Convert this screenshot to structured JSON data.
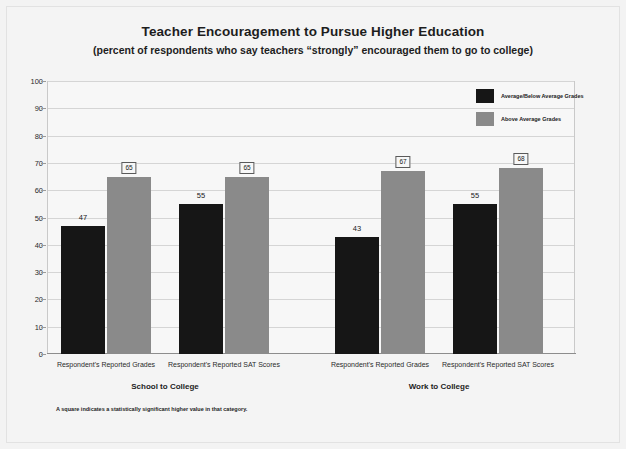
{
  "chart_data": {
    "type": "bar",
    "title": "Teacher Encouragement to Pursue Higher Education",
    "subtitle": "(percent of respondents who say teachers “strongly” encouraged them to go to college)",
    "xlabel": "",
    "ylabel": "",
    "ylim": [
      0,
      100
    ],
    "ytick_labels": [
      "0",
      "10",
      "20",
      "30",
      "40",
      "50",
      "60",
      "70",
      "80",
      "90",
      "100"
    ],
    "ytick_values": [
      0,
      10,
      20,
      30,
      40,
      50,
      60,
      70,
      80,
      90,
      100
    ],
    "grid": true,
    "legend_position": "top-right",
    "groups": [
      {
        "name": "School to College",
        "categories": [
          "Respondent's Reported Grades",
          "Respondent's Reported SAT Scores"
        ]
      },
      {
        "name": "Work to College",
        "categories": [
          "Respondent's Reported Grades",
          "Respondent's Reported SAT Scores"
        ]
      }
    ],
    "categories": [
      "Respondent's Reported Grades",
      "Respondent's Reported SAT Scores",
      "Respondent's Reported Grades",
      "Respondent's Reported SAT Scores"
    ],
    "series": [
      {
        "name": "Average/Below Average Grades",
        "color": "#161616",
        "values": [
          47,
          55,
          43,
          55
        ],
        "significant": [
          false,
          false,
          false,
          false
        ]
      },
      {
        "name": "Above Average Grades",
        "color": "#8a8a8a",
        "values": [
          65,
          65,
          67,
          68
        ],
        "significant": [
          true,
          true,
          true,
          true
        ]
      }
    ],
    "bars": [
      {
        "label": "47",
        "value": 47,
        "series": "Average/Below Average Grades",
        "color": "#161616",
        "significant": false
      },
      {
        "label": "65",
        "value": 65,
        "series": "Above Average Grades",
        "color": "#8a8a8a",
        "significant": true
      },
      {
        "label": "55",
        "value": 55,
        "series": "Average/Below Average Grades",
        "color": "#161616",
        "significant": false
      },
      {
        "label": "65",
        "value": 65,
        "series": "Above Average Grades",
        "color": "#8a8a8a",
        "significant": true
      },
      {
        "label": "43",
        "value": 43,
        "series": "Average/Below Average Grades",
        "color": "#161616",
        "significant": false
      },
      {
        "label": "67",
        "value": 67,
        "series": "Above Average Grades",
        "color": "#8a8a8a",
        "significant": true
      },
      {
        "label": "55",
        "value": 55,
        "series": "Average/Below Average Grades",
        "color": "#161616",
        "significant": false
      },
      {
        "label": "68",
        "value": 68,
        "series": "Above Average Grades",
        "color": "#8a8a8a",
        "significant": true
      }
    ],
    "annotation": "A square indicates a statistically significant higher value in that category."
  },
  "legend": {
    "items": [
      {
        "label": "Average/Below Average Grades",
        "color": "#161616"
      },
      {
        "label": "Above Average Grades",
        "color": "#8a8a8a"
      }
    ]
  }
}
